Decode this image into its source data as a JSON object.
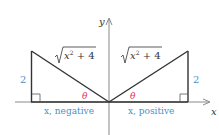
{
  "diagram": {
    "axes": {
      "x_label": "x",
      "y_label": "y",
      "axis_color": "#8a8a8a"
    },
    "left_triangle": {
      "vertical_leg_label": "2",
      "hypotenuse_label_radicand": "x",
      "hypotenuse_label_exponent": "2",
      "hypotenuse_label_rest": " + 4",
      "angle_label": "θ",
      "base_label": "x, negative"
    },
    "right_triangle": {
      "vertical_leg_label": "2",
      "hypotenuse_label_radicand": "x",
      "hypotenuse_label_exponent": "2",
      "hypotenuse_label_rest": " + 4",
      "angle_label": "θ",
      "base_label": "x, positive"
    },
    "colors": {
      "line": "#333333",
      "leg_label": "#4a90c8",
      "angle_label": "#e0306a",
      "text": "#333333"
    }
  }
}
